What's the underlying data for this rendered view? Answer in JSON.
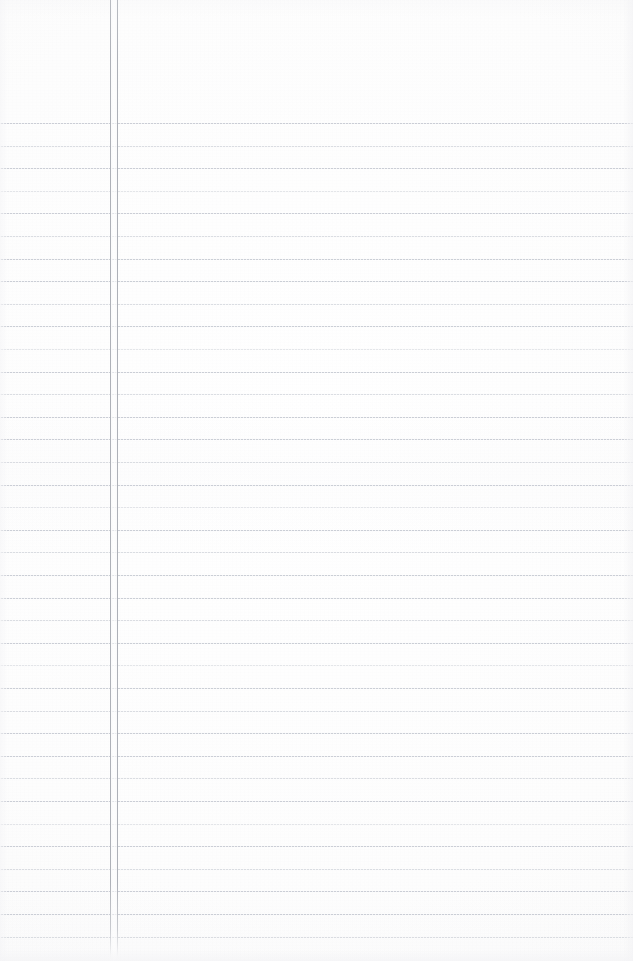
{
  "document": {
    "kind": "scanned-ruled-notepad-page",
    "title": "Blank Ruled Notepad Page",
    "content_text": "",
    "handwriting_present": false,
    "printed_text_present": false,
    "page_width_px": 633,
    "page_height_px": 961
  },
  "colors": {
    "paper": "#fdfdfd",
    "rule_line": "#c6cad2",
    "margin_line": "#aeb1b8",
    "page_edge_shade": "#f3f3f5"
  },
  "layout": {
    "header_zone": {
      "label": "unruled header area",
      "top_px": 0,
      "height_px": 122
    },
    "margin_rules": {
      "label": "vertical double margin rule",
      "count": 2,
      "x_positions_px": [
        110,
        117
      ],
      "top_px": 0,
      "bottom_px": 958
    },
    "horizontal_rules": {
      "label": "horizontal ruled lines",
      "count": 37,
      "first_y_px": 123,
      "spacing_px": 22.6,
      "left_px": 0,
      "right_px": 633
    }
  },
  "rules_y": [
    123,
    145.6,
    168.2,
    190.8,
    213.4,
    236,
    258.6,
    281.2,
    303.8,
    326.4,
    349,
    371.6,
    394.2,
    416.8,
    439.4,
    462,
    484.6,
    507.2,
    529.8,
    552.4,
    575,
    597.6,
    620.2,
    642.8,
    665.4,
    688,
    710.6,
    733.2,
    755.8,
    778.4,
    801,
    823.6,
    846.2,
    868.8,
    891.4,
    914,
    936.6
  ],
  "rule_opacity_class": [
    "",
    "soft",
    "",
    "softer",
    "",
    "soft",
    "",
    "",
    "soft",
    "",
    "softer",
    "",
    "soft",
    "",
    "",
    "soft",
    "",
    "softer",
    "",
    "soft",
    "",
    "",
    "soft",
    "",
    "softer",
    "",
    "soft",
    "",
    "",
    "soft",
    "",
    "softer",
    "",
    "soft",
    "",
    "",
    "soft"
  ]
}
